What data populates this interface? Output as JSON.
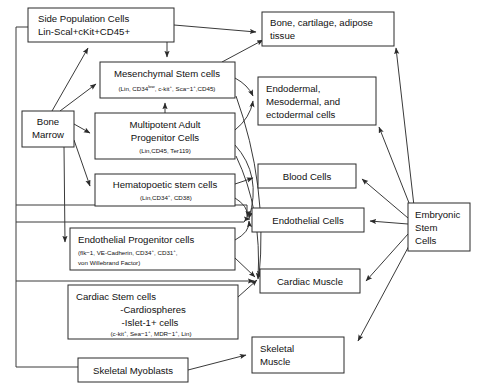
{
  "diagram": {
    "type": "flowchart",
    "nodes": [
      {
        "id": "side-population-cells",
        "lines": [
          "Side Population Cells",
          "Lin-Scal+cKit+CD45+"
        ],
        "x": 28,
        "y": 8,
        "w": 146,
        "h": 34
      },
      {
        "id": "bone-marrow",
        "lines": [
          "Bone",
          "Marrow"
        ],
        "x": 22,
        "y": 111,
        "w": 52,
        "h": 36
      },
      {
        "id": "mesenchymal-stem-cells",
        "lines": [
          "Mesenchymal Stem cells"
        ],
        "sub": "(Lin, CD34low, c-kit+, Sca−1+,CD45)",
        "x": 100,
        "y": 62,
        "w": 135,
        "h": 36
      },
      {
        "id": "multipotent-adult-progenitor-cells",
        "lines": [
          "Multipotent Adult",
          "Progenitor Cells"
        ],
        "sub": "(Lin,CD45, Ter119)",
        "x": 95,
        "y": 113,
        "w": 140,
        "h": 46
      },
      {
        "id": "hematopoetic-stem-cells",
        "lines": [
          "Hematopoetic stem cells"
        ],
        "sub": "(Lin,CD34+, CD38)",
        "x": 95,
        "y": 174,
        "w": 140,
        "h": 32
      },
      {
        "id": "endothelial-progenitor-cells",
        "lines": [
          "Endothelial Progenitor cells"
        ],
        "sub1": "(flk−1, VE-Cadherin, CD34+, CD31+,",
        "sub2": "von Willebrand Factor)",
        "x": 70,
        "y": 228,
        "w": 165,
        "h": 42
      },
      {
        "id": "cardiac-stem-cells",
        "lines": [
          "Cardiac Stem cells",
          "-Cardiospheres",
          "-Islet-1+ cells"
        ],
        "sub": "(c-kit+, Sea−1+, MDR−1+, Lin)",
        "x": 68,
        "y": 285,
        "w": 170,
        "h": 54
      },
      {
        "id": "skeletal-myoblasts",
        "lines": [
          "Skeletal Myoblasts"
        ],
        "x": 78,
        "y": 358,
        "w": 110,
        "h": 24
      },
      {
        "id": "bone-cartilage-adipose-tissue",
        "lines": [
          "Bone, cartilage, adipose",
          "tissue"
        ],
        "x": 262,
        "y": 12,
        "w": 132,
        "h": 34
      },
      {
        "id": "endodermal-mesodermal-ectodermal-cells",
        "lines": [
          "Endodermal,",
          "Mesodermal, and",
          "ectodermal cells"
        ],
        "x": 258,
        "y": 77,
        "w": 118,
        "h": 48
      },
      {
        "id": "blood-cells",
        "lines": [
          "Blood Cells"
        ],
        "x": 258,
        "y": 164,
        "w": 98,
        "h": 24
      },
      {
        "id": "endothelial-cells",
        "lines": [
          "Endothelial Cells"
        ],
        "x": 252,
        "y": 208,
        "w": 112,
        "h": 24
      },
      {
        "id": "cardiac-muscle",
        "lines": [
          "Cardiac Muscle"
        ],
        "x": 260,
        "y": 269,
        "w": 100,
        "h": 24
      },
      {
        "id": "skeletal-muscle",
        "lines": [
          "Skeletal",
          "Muscle"
        ],
        "x": 252,
        "y": 337,
        "w": 92,
        "h": 36
      },
      {
        "id": "embryonic-stem-cells",
        "lines": [
          "Embryonic",
          "Stem",
          "Cells"
        ],
        "x": 408,
        "y": 203,
        "w": 62,
        "h": 48
      }
    ],
    "edge_count": 24
  }
}
